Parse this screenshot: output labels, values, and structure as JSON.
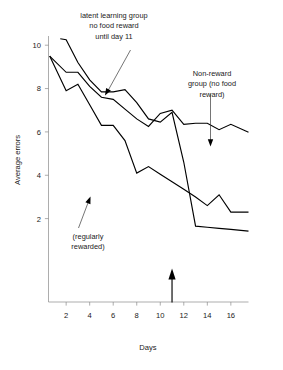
{
  "figure": {
    "background_color": "#ffffff",
    "line_color": "#000000",
    "axis_color": "#8a8a8a",
    "text_color": "#1a1a1a"
  },
  "annotations": {
    "latent": {
      "name": "latent-learning-annotation",
      "lines": [
        "latent learning group",
        "no food reward",
        "until day 11"
      ]
    },
    "nonreward": {
      "name": "non-reward-annotation",
      "lines": [
        "Non-reward",
        "group (no food",
        "reward)"
      ]
    },
    "rewarded": {
      "name": "regularly-rewarded-annotation",
      "lines": [
        "(regularly",
        "rewarded)"
      ]
    },
    "day11_marker": {
      "name": "day-11-up-arrow",
      "value": 11
    }
  },
  "chart_data": {
    "type": "line",
    "title": "",
    "subtitle": "",
    "xlabel": "Days",
    "ylabel": "Average errors",
    "xlim": [
      0.5,
      17.5
    ],
    "ylim": [
      0.4,
      10.6
    ],
    "xticks": [
      2,
      4,
      6,
      8,
      10,
      12,
      14,
      16
    ],
    "xtick_labels": [
      "2",
      "4",
      "6",
      "8",
      "10",
      "12",
      "14",
      "16"
    ],
    "yticks": [
      2,
      4,
      6,
      8,
      10
    ],
    "ytick_labels": [
      "2",
      "4",
      "6",
      "8",
      "10"
    ],
    "grid": false,
    "legend_position": "none",
    "annotated_arrow_x": 11,
    "series": [
      {
        "name": "latent learning group (no food reward until day 11)",
        "label_lines": [
          "latent learning group",
          "no food reward",
          "until day 11"
        ],
        "x": [
          1.5,
          2,
          3,
          4,
          5,
          6,
          7,
          8,
          9,
          10,
          11,
          12,
          13,
          14,
          15,
          16,
          17.5
        ],
        "y": [
          10.3,
          10.25,
          9.2,
          8.4,
          7.85,
          7.85,
          7.95,
          7.35,
          6.6,
          6.45,
          6.9,
          4.6,
          1.65,
          1.6,
          1.55,
          1.5,
          1.42
        ]
      },
      {
        "name": "Non-reward group (no food reward)",
        "label_lines": [
          "Non-reward",
          "group (no food",
          "reward)"
        ],
        "x": [
          0.6,
          2,
          3,
          4,
          5,
          6,
          7,
          8,
          9,
          10,
          11,
          12,
          13,
          14,
          15,
          16,
          17.5
        ],
        "y": [
          9.5,
          8.75,
          8.75,
          8.1,
          7.6,
          7.5,
          7.05,
          6.6,
          6.25,
          6.85,
          7.0,
          6.35,
          6.4,
          6.4,
          6.1,
          6.35,
          5.98
        ]
      },
      {
        "name": "regularly rewarded",
        "label_lines": [
          "(regularly",
          "rewarded)"
        ],
        "x": [
          0.6,
          2,
          3,
          4,
          5,
          6,
          7,
          8,
          9,
          10,
          11,
          12,
          13,
          14,
          15,
          16,
          17.5
        ],
        "y": [
          9.5,
          7.9,
          8.2,
          7.25,
          6.3,
          6.3,
          5.6,
          4.1,
          4.4,
          4.05,
          3.7,
          3.35,
          3.0,
          2.6,
          3.1,
          2.3,
          2.3
        ]
      }
    ]
  }
}
